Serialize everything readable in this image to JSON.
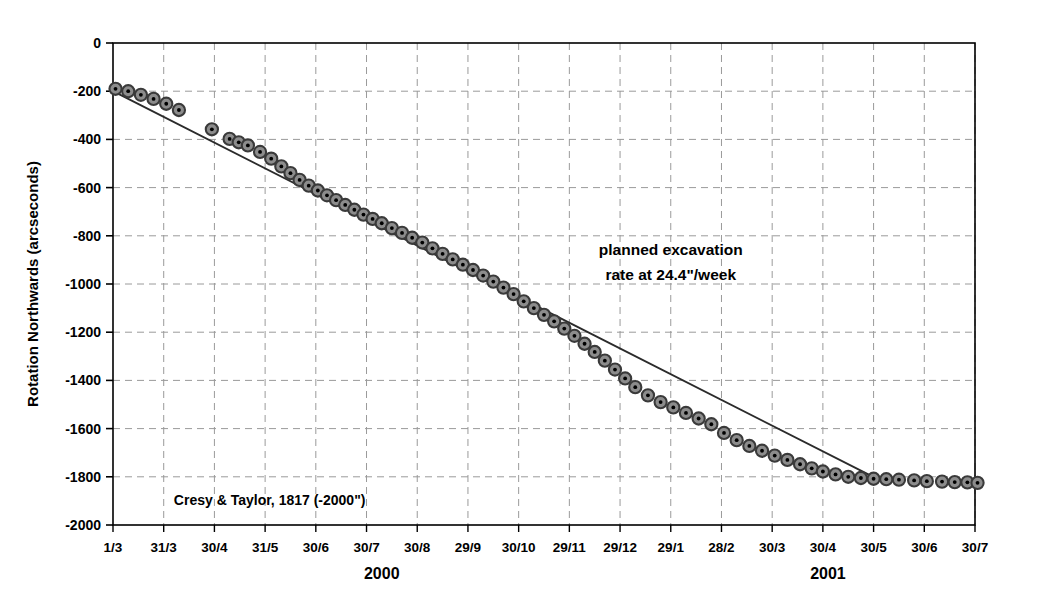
{
  "chart_data": {
    "type": "scatter",
    "title": "",
    "xlabel": "",
    "ylabel": "Rotation Northwards (arcseconds)",
    "ylim": [
      -2000,
      0
    ],
    "ytick_values": [
      0,
      -200,
      -400,
      -600,
      -800,
      -1000,
      -1200,
      -1400,
      -1600,
      -1800,
      -2000
    ],
    "ytick_labels": [
      "0",
      "-200",
      "-400",
      "-600",
      "-800",
      "-1000",
      "-1200",
      "-1400",
      "-1600",
      "-1800",
      "-2000"
    ],
    "xtick_labels": [
      "1/3",
      "31/3",
      "30/4",
      "31/5",
      "30/6",
      "30/7",
      "30/8",
      "29/9",
      "30/10",
      "29/11",
      "29/12",
      "29/1",
      "28/2",
      "30/3",
      "30/4",
      "30/5",
      "30/6",
      "30/7"
    ],
    "x_group_labels": [
      "2000",
      "2001"
    ],
    "grid": true,
    "grid_style": "dashed",
    "legend_position": "none",
    "series": [
      {
        "name": "measured rotation",
        "marker": "circle-with-center-dot",
        "x": [
          0.05,
          0.3,
          0.55,
          0.8,
          1.05,
          1.3,
          1.95,
          2.3,
          2.48,
          2.66,
          2.9,
          3.12,
          3.32,
          3.5,
          3.68,
          3.86,
          4.04,
          4.22,
          4.4,
          4.58,
          4.76,
          4.94,
          5.12,
          5.3,
          5.5,
          5.7,
          5.9,
          6.1,
          6.3,
          6.5,
          6.7,
          6.9,
          7.1,
          7.3,
          7.5,
          7.7,
          7.9,
          8.1,
          8.3,
          8.5,
          8.7,
          8.9,
          9.1,
          9.3,
          9.5,
          9.7,
          9.9,
          10.1,
          10.3,
          10.55,
          10.8,
          11.05,
          11.3,
          11.55,
          11.8,
          12.05,
          12.3,
          12.55,
          12.8,
          13.05,
          13.3,
          13.55,
          13.78,
          14.0,
          14.25,
          14.5,
          14.75,
          15.0,
          15.25,
          15.5,
          15.8,
          16.05,
          16.35,
          16.6,
          16.85,
          17.05
        ],
        "y": [
          -190,
          -200,
          -215,
          -232,
          -252,
          -278,
          -358,
          -398,
          -412,
          -425,
          -452,
          -480,
          -512,
          -540,
          -568,
          -592,
          -612,
          -632,
          -652,
          -672,
          -692,
          -712,
          -730,
          -748,
          -768,
          -788,
          -808,
          -828,
          -852,
          -875,
          -898,
          -920,
          -942,
          -965,
          -990,
          -1015,
          -1042,
          -1072,
          -1100,
          -1128,
          -1155,
          -1185,
          -1215,
          -1248,
          -1282,
          -1318,
          -1355,
          -1392,
          -1428,
          -1462,
          -1490,
          -1512,
          -1535,
          -1558,
          -1582,
          -1618,
          -1648,
          -1672,
          -1692,
          -1712,
          -1730,
          -1748,
          -1765,
          -1778,
          -1790,
          -1800,
          -1805,
          -1808,
          -1810,
          -1812,
          -1815,
          -1818,
          -1820,
          -1822,
          -1823,
          -1825
        ]
      }
    ],
    "trendline": {
      "label": "planned excavation rate at 24.4\"/week",
      "start": {
        "x": 0.0,
        "y": -200
      },
      "end": {
        "x": 15.1,
        "y": -1812
      },
      "rate_per_week": 24.4,
      "units": "arcseconds"
    },
    "annotations": [
      {
        "name": "planned-rate-annotation",
        "lines": [
          "planned excavation",
          "rate at 24.4\"/week"
        ],
        "x": 11.0,
        "y": -880
      },
      {
        "name": "source-annotation",
        "lines": [
          "Cresy & Taylor, 1817 (-2000\")"
        ],
        "x": 1.2,
        "y": -1915
      }
    ]
  },
  "colors": {
    "axis": "#000000",
    "grid": "#9a9a9a",
    "marker_ring": "#3a3a3a",
    "marker_fill": "#8c8c8c",
    "marker_dot": "#000000",
    "trendline": "#2b2b2b",
    "background": "#ffffff",
    "text": "#000000"
  }
}
